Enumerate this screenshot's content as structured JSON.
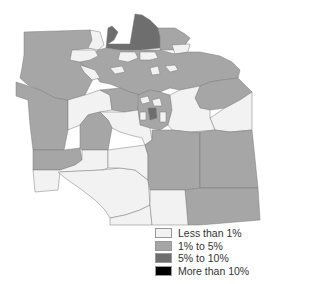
{
  "map": {
    "type": "choropleth",
    "colors": {
      "less_than_1": "#f2f2f2",
      "1_to_5": "#a6a6a6",
      "5_to_10": "#6e6e6e",
      "more_than_10": "#000000",
      "border": "#7a7a7a"
    }
  },
  "legend": {
    "items": [
      {
        "label": "Less than 1%",
        "color": "#f2f2f2"
      },
      {
        "label": "1% to 5%",
        "color": "#a6a6a6"
      },
      {
        "label": "5% to 10%",
        "color": "#6e6e6e"
      },
      {
        "label": "More than 10%",
        "color": "#000000"
      }
    ]
  }
}
